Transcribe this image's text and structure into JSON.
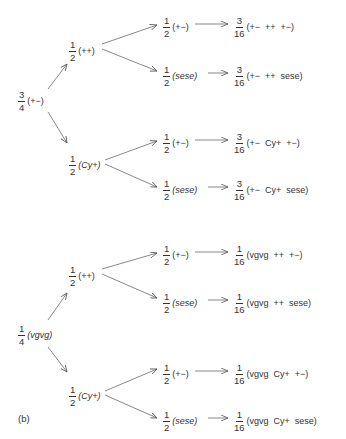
{
  "diagram": {
    "type": "probability tree (genetic cross)",
    "panel_a": {
      "root": {
        "num": "3",
        "den": "4",
        "genotype": "(+−)"
      },
      "branches": [
        {
          "node": {
            "num": "1",
            "den": "2",
            "genotype": "(++)"
          },
          "children": [
            {
              "node": {
                "num": "1",
                "den": "2",
                "genotype": "(+−)"
              },
              "result": {
                "num": "3",
                "den": "16",
                "genotype": "(+−  ++  +−)"
              }
            },
            {
              "node": {
                "num": "1",
                "den": "2",
                "genotype": "(sese)"
              },
              "result": {
                "num": "3",
                "den": "16",
                "genotype": "(+−  ++  sese)"
              }
            }
          ]
        },
        {
          "node": {
            "num": "1",
            "den": "2",
            "genotype": "(Cy+)"
          },
          "children": [
            {
              "node": {
                "num": "1",
                "den": "2",
                "genotype": "(+−)"
              },
              "result": {
                "num": "3",
                "den": "16",
                "genotype": "(+−  Cy+  +−)"
              }
            },
            {
              "node": {
                "num": "1",
                "den": "2",
                "genotype": "(sese)"
              },
              "result": {
                "num": "3",
                "den": "16",
                "genotype": "(+−  Cy+  sese)"
              }
            }
          ]
        }
      ]
    },
    "panel_b": {
      "label": "(b)",
      "root": {
        "num": "1",
        "den": "4",
        "genotype": "(vgvg)"
      },
      "branches": [
        {
          "node": {
            "num": "1",
            "den": "2",
            "genotype": "(++)"
          },
          "children": [
            {
              "node": {
                "num": "1",
                "den": "2",
                "genotype": "(+−)"
              },
              "result": {
                "num": "1",
                "den": "16",
                "genotype": "(vgvg  ++  +−)"
              }
            },
            {
              "node": {
                "num": "1",
                "den": "2",
                "genotype": "(sese)"
              },
              "result": {
                "num": "1",
                "den": "16",
                "genotype": "(vgvg  ++  sese)"
              }
            }
          ]
        },
        {
          "node": {
            "num": "1",
            "den": "2",
            "genotype": "(Cy+)"
          },
          "children": [
            {
              "node": {
                "num": "1",
                "den": "2",
                "genotype": "(+−)"
              },
              "result": {
                "num": "1",
                "den": "16",
                "genotype": "(vgvg  Cy+  +−)"
              }
            },
            {
              "node": {
                "num": "1",
                "den": "2",
                "genotype": "(sese)"
              },
              "result": {
                "num": "1",
                "den": "16",
                "genotype": "(vgvg  Cy+  sese)"
              }
            }
          ]
        }
      ]
    },
    "line_color": "#555555",
    "text_color": "#333333"
  }
}
